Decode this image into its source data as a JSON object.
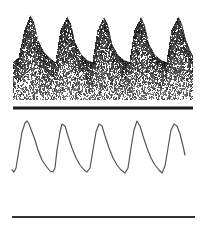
{
  "figure": {
    "width": 207,
    "height": 228,
    "background": "#ffffff",
    "ink_color": "#1a1a1a",
    "trace_color": "#555555"
  },
  "spectrogram": {
    "panel": "top",
    "description": "Doppler spectral waveform with five pulsatile cycles",
    "cycles": 5,
    "x_start": 13,
    "x_end": 193,
    "fill_bottom_y": 100,
    "envelope": [
      [
        13,
        62
      ],
      [
        18,
        58
      ],
      [
        24,
        30
      ],
      [
        30,
        15
      ],
      [
        34,
        22
      ],
      [
        38,
        40
      ],
      [
        44,
        52
      ],
      [
        50,
        58
      ],
      [
        55,
        62
      ],
      [
        60,
        30
      ],
      [
        67,
        16
      ],
      [
        71,
        24
      ],
      [
        75,
        42
      ],
      [
        81,
        54
      ],
      [
        87,
        60
      ],
      [
        92,
        62
      ],
      [
        97,
        30
      ],
      [
        104,
        17
      ],
      [
        108,
        25
      ],
      [
        112,
        44
      ],
      [
        118,
        55
      ],
      [
        124,
        60
      ],
      [
        129,
        62
      ],
      [
        134,
        30
      ],
      [
        141,
        17
      ],
      [
        145,
        26
      ],
      [
        149,
        44
      ],
      [
        155,
        55
      ],
      [
        161,
        60
      ],
      [
        166,
        62
      ],
      [
        171,
        30
      ],
      [
        178,
        16
      ],
      [
        182,
        24
      ],
      [
        186,
        40
      ],
      [
        190,
        50
      ],
      [
        193,
        56
      ]
    ],
    "baseline": {
      "y": 108,
      "x1": 13,
      "x2": 193,
      "thickness": 3
    }
  },
  "waveform": {
    "panel": "bottom",
    "description": "Continuous pressure/flow tracing, five cycles",
    "points": [
      [
        12,
        170
      ],
      [
        14,
        172
      ],
      [
        16,
        168
      ],
      [
        19,
        150
      ],
      [
        22,
        132
      ],
      [
        25,
        123
      ],
      [
        27,
        121
      ],
      [
        29,
        124
      ],
      [
        32,
        132
      ],
      [
        35,
        140
      ],
      [
        38,
        150
      ],
      [
        42,
        160
      ],
      [
        46,
        166
      ],
      [
        50,
        171
      ],
      [
        53,
        172
      ],
      [
        55,
        168
      ],
      [
        57,
        150
      ],
      [
        60,
        132
      ],
      [
        62,
        124
      ],
      [
        65,
        126
      ],
      [
        68,
        136
      ],
      [
        72,
        148
      ],
      [
        76,
        158
      ],
      [
        80,
        165
      ],
      [
        84,
        170
      ],
      [
        87,
        172
      ],
      [
        90,
        168
      ],
      [
        93,
        150
      ],
      [
        96,
        132
      ],
      [
        99,
        124
      ],
      [
        102,
        126
      ],
      [
        105,
        136
      ],
      [
        109,
        148
      ],
      [
        113,
        158
      ],
      [
        117,
        165
      ],
      [
        121,
        170
      ],
      [
        125,
        173
      ],
      [
        128,
        168
      ],
      [
        131,
        148
      ],
      [
        134,
        130
      ],
      [
        137,
        121
      ],
      [
        140,
        126
      ],
      [
        143,
        136
      ],
      [
        147,
        148
      ],
      [
        151,
        158
      ],
      [
        155,
        165
      ],
      [
        159,
        170
      ],
      [
        162,
        173
      ],
      [
        165,
        166
      ],
      [
        168,
        148
      ],
      [
        171,
        130
      ],
      [
        174,
        124
      ],
      [
        177,
        126
      ],
      [
        180,
        134
      ],
      [
        183,
        146
      ],
      [
        185,
        155
      ]
    ],
    "baseline": {
      "y": 217,
      "x1": 12,
      "x2": 195,
      "thickness": 2
    }
  }
}
